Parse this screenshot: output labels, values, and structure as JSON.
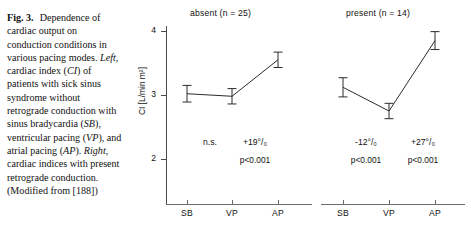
{
  "caption": {
    "figure_label": "Fig. 3.",
    "text_segments": [
      {
        "t": "Dependence of cardiac output on conduction conditions in various pacing modes. ",
        "style": "normal"
      },
      {
        "t": "Left",
        "style": "italic"
      },
      {
        "t": ", cardiac index (",
        "style": "normal"
      },
      {
        "t": "CI",
        "style": "italic"
      },
      {
        "t": ") of patients with sick sinus syndrome without retrograde conduction with sinus bradycardia (",
        "style": "normal"
      },
      {
        "t": "SB",
        "style": "italic"
      },
      {
        "t": "), ventricular pacing (",
        "style": "normal"
      },
      {
        "t": "VP",
        "style": "italic"
      },
      {
        "t": "), and atrial pacing (",
        "style": "normal"
      },
      {
        "t": "AP",
        "style": "italic"
      },
      {
        "t": "). ",
        "style": "normal"
      },
      {
        "t": "Right",
        "style": "italic"
      },
      {
        "t": ", cardiac indices with present retrograde conduction. (Modified from [188])",
        "style": "normal"
      }
    ],
    "full_text": "Fig. 3. Dependence of cardiac output on conduction conditions in various pacing modes. Left, cardiac index (CI) of patients with sick sinus syndrome without retrograde conduction with sinus bradycardia (SB), ventricular pacing (VP), and atrial pacing (AP). Right, cardiac indices with present retrograde conduction. (Modified from [188])",
    "reference": "[188]"
  },
  "axis": {
    "y_title": "CI [L/min m²]",
    "y_ticks": [
      "4",
      "3",
      "2"
    ],
    "y_min": 1.6,
    "y_max": 4.2
  },
  "panels": {
    "left": {
      "title": "absent  (n = 25)",
      "condition": "absent",
      "n": 25,
      "categories": [
        "SB",
        "VP",
        "AP"
      ],
      "annotations": [
        {
          "pct": "n.s.",
          "p": ""
        },
        {
          "pct": "+19°/₀",
          "p": "p<0.001"
        }
      ]
    },
    "right": {
      "title": "present  (n = 14)",
      "condition": "present",
      "n": 14,
      "categories": [
        "SB",
        "VP",
        "AP"
      ],
      "annotations": [
        {
          "pct": "-12°/₀",
          "p": "p<0.001"
        },
        {
          "pct": "+27°/₀",
          "p": "p<0.001"
        }
      ]
    }
  },
  "chart_data": {
    "type": "line",
    "title": "Dependence of cardiac output on conduction conditions in various pacing modes",
    "xlabel": "",
    "ylabel": "CI [L/min m²]",
    "ylim": [
      1.6,
      4.2
    ],
    "yticks": [
      2,
      3,
      4
    ],
    "grid": false,
    "legend": "none",
    "categories": [
      "SB",
      "VP",
      "AP"
    ],
    "panels": [
      {
        "name": "absent (n = 25)",
        "retrograde_conduction": "absent",
        "n": 25,
        "values": [
          3.02,
          2.98,
          3.55
        ],
        "errors": [
          0.13,
          0.12,
          0.12
        ],
        "annotations": [
          "n.s.",
          "+19% p<0.001"
        ]
      },
      {
        "name": "present (n = 14)",
        "retrograde_conduction": "present",
        "n": 14,
        "values": [
          3.12,
          2.75,
          3.85
        ],
        "errors": [
          0.15,
          0.12,
          0.14
        ],
        "annotations": [
          "-12% p<0.001",
          "+27% p<0.001"
        ]
      }
    ]
  }
}
